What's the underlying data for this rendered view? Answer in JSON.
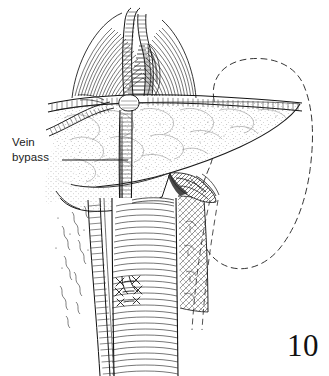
{
  "figure": {
    "number": "10",
    "domain": "medical-surgical-illustration",
    "background_color": "#ffffff",
    "ink_color": "#1b1b1b",
    "stipple_color": "#6f6f6f"
  },
  "labels": [
    {
      "id": "vein-bypass",
      "line1": "Vein",
      "line2": "bypass",
      "leader": {
        "from_x": 62,
        "from_y": 160,
        "to_x": 128,
        "to_y": 160
      }
    }
  ],
  "structures": {
    "pancreas": {
      "name": "pancreas",
      "render": "stippled-wedge",
      "tail_tip_x": 302,
      "tail_tip_y": 104
    },
    "splenic_artery": {
      "name": "splenic-artery",
      "render": "banded-tube-horizontal"
    },
    "vein_graft": {
      "name": "vein-bypass-graft",
      "render": "banded-tube-vertical"
    },
    "aorta": {
      "name": "aorta",
      "render": "hatched-tube-vertical"
    },
    "kidney": {
      "name": "kidney-outline",
      "render": "dashed-outline"
    },
    "diaphragm_crura": {
      "name": "diaphragmatic-crura",
      "render": "linear-hatching"
    },
    "anastomosis": {
      "name": "aortic-anastomosis-sutures",
      "render": "x-knots"
    },
    "retroperitoneal_tissue": {
      "name": "retroperitoneal-tissue",
      "render": "cross-hatching"
    },
    "nerve_fibers": {
      "name": "nerve-fibers",
      "render": "squiggles"
    }
  }
}
